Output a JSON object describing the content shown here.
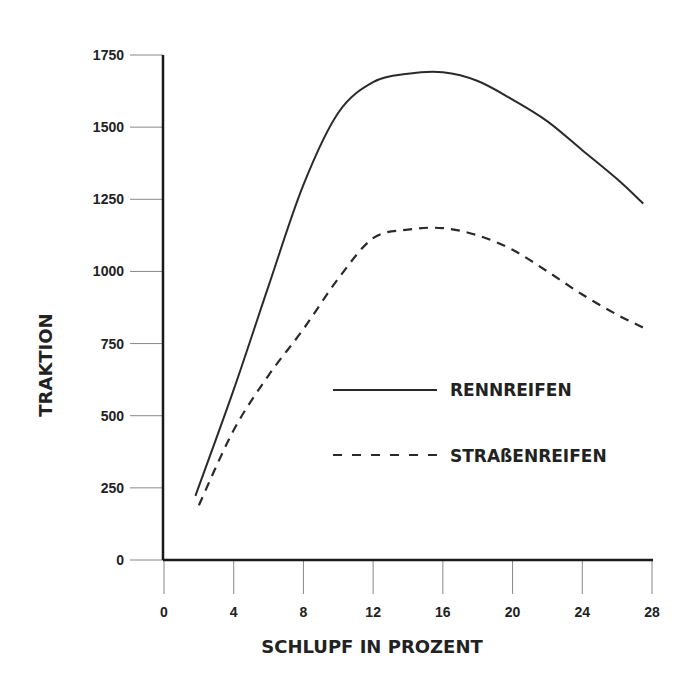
{
  "chart_data": {
    "type": "line",
    "title": "",
    "xlabel": "SCHLUPF IN PROZENT",
    "ylabel": "TRAKTION",
    "xlim": [
      0,
      28
    ],
    "ylim": [
      0,
      1750
    ],
    "xticks": [
      0,
      4,
      8,
      12,
      16,
      20,
      24,
      28
    ],
    "yticks": [
      0,
      250,
      500,
      750,
      1000,
      1250,
      1500,
      1750
    ],
    "grid": false,
    "legend_position": "inside center-right",
    "series": [
      {
        "name": "RENNREIFEN",
        "style": "solid",
        "x": [
          1.8,
          4,
          6,
          8,
          10,
          12,
          14,
          16,
          18,
          20,
          22,
          24,
          26,
          27.5
        ],
        "y": [
          222,
          590,
          950,
          1300,
          1550,
          1656,
          1685,
          1690,
          1660,
          1595,
          1520,
          1420,
          1320,
          1235
        ]
      },
      {
        "name": "STRAßENREIFEN",
        "style": "dashed",
        "x": [
          2.0,
          4,
          6,
          8,
          10,
          12,
          14,
          16,
          18,
          20,
          22,
          24,
          26,
          27.5
        ],
        "y": [
          190,
          450,
          640,
          800,
          975,
          1115,
          1145,
          1150,
          1125,
          1075,
          1000,
          920,
          850,
          805
        ]
      }
    ]
  },
  "legend": {
    "items": [
      {
        "label": "RENNREIFEN",
        "style": "solid"
      },
      {
        "label": "STRAßENREIFEN",
        "style": "dashed"
      }
    ]
  },
  "colors": {
    "line": "#2a2a2a",
    "axis": "#1a1a1a",
    "tick": "#888888"
  }
}
